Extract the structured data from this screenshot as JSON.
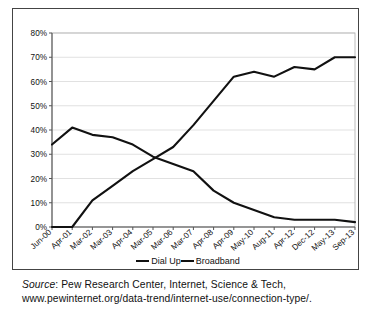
{
  "chart_data": {
    "type": "line",
    "title": "",
    "subtitle": "",
    "xlabel": "",
    "ylabel": "",
    "ylim": [
      0,
      80
    ],
    "ytick_labels": [
      "0%",
      "10%",
      "20%",
      "30%",
      "40%",
      "50%",
      "60%",
      "70%",
      "80%"
    ],
    "ytick_values": [
      0,
      10,
      20,
      30,
      40,
      50,
      60,
      70,
      80
    ],
    "grid": true,
    "legend_position": "bottom",
    "categories": [
      "Jun-00",
      "Apr-01",
      "Mar-02",
      "Mar-03",
      "Apr-04",
      "Mar-05",
      "Mar-06",
      "Mar-07",
      "Apr-08",
      "Apr-09",
      "May-10",
      "Aug-11",
      "Apr-12",
      "Dec-12",
      "May-13",
      "Sep-13"
    ],
    "series": [
      {
        "name": "Dial Up",
        "color": "#111111",
        "values": [
          34,
          41,
          38,
          37,
          34,
          29,
          26,
          23,
          15,
          10,
          7,
          4,
          3,
          3,
          3,
          2
        ]
      },
      {
        "name": "Broadband",
        "color": "#111111",
        "values": [
          0,
          0,
          11,
          17,
          23,
          28,
          33,
          42,
          52,
          62,
          64,
          62,
          66,
          65,
          70,
          70
        ]
      }
    ]
  },
  "legend": {
    "items": [
      {
        "label": "Dial Up"
      },
      {
        "label": "Broadband"
      }
    ]
  },
  "caption": {
    "source_word": "Source",
    "line1_rest": ": Pew Research Center, Internet, Science & Tech,",
    "line2": "www.pewinternet.org/data-trend/internet-use/connection-type/."
  }
}
